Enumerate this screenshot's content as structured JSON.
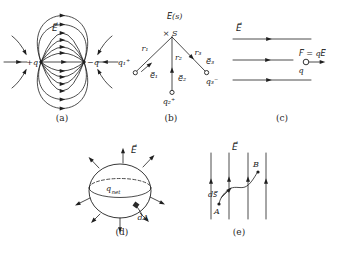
{
  "figure": {
    "ink_color": "#1f1f1f",
    "background_color": "#ffffff"
  },
  "panel_a": {
    "caption": "(a)",
    "field_label": "E⃗",
    "positive_charge_label": "+q",
    "negative_charge_label": "−q"
  },
  "panel_b": {
    "caption": "(b)",
    "field_at_point_label": "E⃗(s)",
    "point_marker": "×",
    "point_label": "S",
    "distance_labels": {
      "r1": "r₁",
      "r2": "r₂",
      "r3": "r₃"
    },
    "unit_vector_labels": {
      "e1": "e⃗₁",
      "e2": "e⃗₂",
      "e3": "e⃗₃"
    },
    "charge_labels": {
      "q1": "q₁⁺",
      "q2": "q₂⁺",
      "q3": "q₃⁻"
    }
  },
  "panel_c": {
    "caption": "(c)",
    "field_label": "E⃗",
    "force_equation": "F⃗ = qE⃗",
    "charge_label": "q"
  },
  "panel_d": {
    "caption": "(d)",
    "field_label": "E⃗",
    "enclosed_charge_base": "q",
    "enclosed_charge_subscript": "net",
    "area_element_label": "dA"
  },
  "panel_e": {
    "caption": "(e)",
    "field_label": "E⃗",
    "start_point_label": "A",
    "end_point_label": "B",
    "path_element_label": "ds⃗"
  }
}
